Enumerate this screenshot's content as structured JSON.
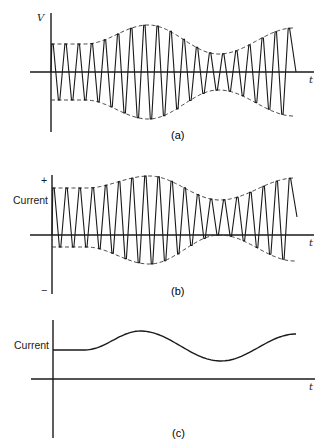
{
  "figure": {
    "panels": [
      {
        "id": "a",
        "caption": "(a)",
        "y_label": "V",
        "x_label": "t",
        "description": "Amplitude-modulated carrier voltage with dashed envelope"
      },
      {
        "id": "b",
        "caption": "(b)",
        "y_label": "Current",
        "plus_label": "+",
        "minus_label": "−",
        "x_label": "t",
        "description": "Current through detector: modulated carrier shifted upward (mostly positive)"
      },
      {
        "id": "c",
        "caption": "(c)",
        "y_label": "Current",
        "x_label": "t",
        "description": "Averaged (detected) current following the envelope"
      }
    ]
  },
  "chart_data": [
    {
      "type": "line",
      "title": "(a)",
      "xlabel": "t",
      "ylabel": "V",
      "carrier_cycles": 18.5,
      "envelope_points_x": [
        0,
        0.14,
        0.4,
        0.69,
        1.0
      ],
      "upper_envelope": [
        28,
        28,
        47,
        18,
        44
      ],
      "lower_envelope": [
        -28,
        -28,
        -47,
        -18,
        -44
      ],
      "grid": false
    },
    {
      "type": "line",
      "title": "(b)",
      "xlabel": "t",
      "ylabel": "Current",
      "carrier_cycles": 18.5,
      "envelope_points_x": [
        0,
        0.14,
        0.4,
        0.69,
        1.0
      ],
      "upper_envelope": [
        47,
        47,
        59,
        35,
        57
      ],
      "lower_envelope": [
        -12,
        -12,
        -29,
        0,
        -26
      ],
      "grid": false
    },
    {
      "type": "line",
      "title": "(c)",
      "xlabel": "t",
      "ylabel": "Current",
      "x": [
        0,
        0.13,
        0.36,
        0.69,
        1.0
      ],
      "y": [
        29,
        29,
        48,
        18,
        45
      ],
      "grid": false
    }
  ]
}
